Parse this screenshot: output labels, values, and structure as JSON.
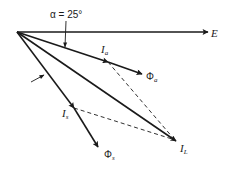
{
  "diagram": {
    "type": "phasor-diagram",
    "origin": [
      17,
      32
    ],
    "angle_annotation": {
      "label": "α = 25°",
      "symbol": "α",
      "value": "25°"
    },
    "vectors": [
      {
        "id": "E",
        "label": "E",
        "sub": "",
        "tip": [
          208,
          32
        ]
      },
      {
        "id": "Ia",
        "label": "I",
        "sub": "a",
        "tip": [
          108,
          62
        ]
      },
      {
        "id": "Phia",
        "label": "Φ",
        "sub": "a",
        "tip": [
          142,
          74
        ]
      },
      {
        "id": "IL",
        "label": "I",
        "sub": "L",
        "tip": [
          176,
          141
        ]
      },
      {
        "id": "Is",
        "label": "I",
        "sub": "s",
        "tip": [
          74,
          108
        ]
      },
      {
        "id": "Phis",
        "label": "Φ",
        "sub": "s",
        "tip": [
          98,
          147
        ]
      }
    ],
    "dashed_lines": [
      {
        "from": "Ia",
        "to": "IL"
      },
      {
        "from": "Is",
        "to": "IL"
      }
    ],
    "labels": {
      "E": "E",
      "Ia_main": "I",
      "Ia_sub": "a",
      "Phia_main": "Φ",
      "Phia_sub": "a",
      "IL_main": "I",
      "IL_sub": "L",
      "Is_main": "I",
      "Is_sub": "s",
      "Phis_main": "Φ",
      "Phis_sub": "s",
      "alpha": "α = 25°"
    }
  }
}
